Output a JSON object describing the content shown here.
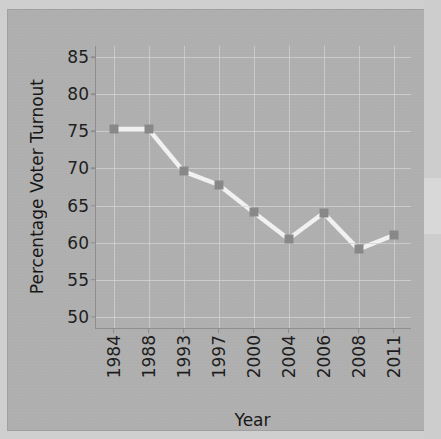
{
  "chart_data": {
    "type": "line",
    "title": "",
    "xlabel": "Year",
    "ylabel": "Percentage Voter Turnout",
    "categories": [
      "1984",
      "1988",
      "1993",
      "1997",
      "2000",
      "2004",
      "2006",
      "2008",
      "2011"
    ],
    "values": [
      75.3,
      75.3,
      69.6,
      67.8,
      64.1,
      60.5,
      64.0,
      59.1,
      61.0
    ],
    "series": [
      {
        "name": "Percentage Voter Turnout",
        "values": [
          75.3,
          75.3,
          69.6,
          67.8,
          64.1,
          60.5,
          64.0,
          59.1,
          61.0
        ]
      }
    ],
    "ylim": [
      48.5,
      86.5
    ],
    "yticks": [
      50,
      55,
      60,
      65,
      70,
      75,
      80,
      85
    ],
    "ytick_labels": [
      "50",
      "55",
      "60",
      "65",
      "70",
      "75",
      "80",
      "85"
    ],
    "xtick_labels": [
      "1984",
      "1988",
      "1993",
      "1997",
      "2000",
      "2004",
      "2006",
      "2008",
      "2011"
    ],
    "grid": true,
    "legend": "none",
    "line_color": "#f2f2f2",
    "marker_color": "#888888",
    "plot_background": "#b0b0b0",
    "grid_color": "#d6d6d6",
    "axis_color": "#8f8f8f",
    "text_color": "#1d1d1d"
  }
}
